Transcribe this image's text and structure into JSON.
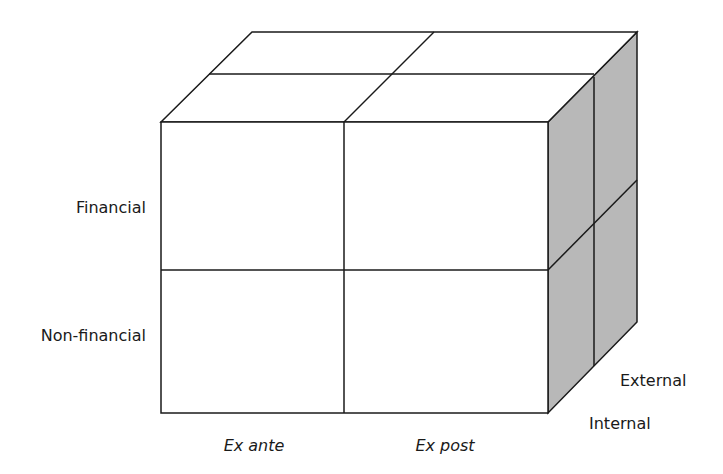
{
  "diagram": {
    "type": "3d-cube-matrix",
    "colors": {
      "stroke": "#1a1a1a",
      "front_fill": "#ffffff",
      "top_fill": "#ffffff",
      "side_fill": "#b8b8b8"
    },
    "row_labels": [
      "Financial",
      "Non-financial"
    ],
    "column_labels": [
      "Ex ante",
      "Ex post"
    ],
    "depth_labels": [
      "External",
      "Internal"
    ]
  }
}
